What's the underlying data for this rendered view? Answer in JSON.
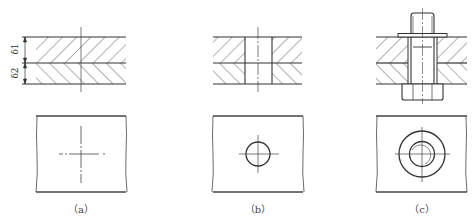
{
  "figure": {
    "panels": [
      {
        "id": "a",
        "label": "（a）",
        "top_view": "plates with centerlines only",
        "feature": "no hole"
      },
      {
        "id": "b",
        "label": "（b）",
        "top_view": "single circle with centerlines",
        "feature": "drilled hole"
      },
      {
        "id": "c",
        "label": "（c）",
        "top_view": "concentric circles (washer, bolt) with centerlines",
        "feature": "bolt with washer and nut"
      }
    ],
    "dimensions": {
      "upper_plate": "δ1",
      "lower_plate": "δ2"
    },
    "colors": {
      "line": "#333333",
      "hatch": "#555555",
      "centerline": "#444444",
      "background": "#ffffff"
    }
  }
}
